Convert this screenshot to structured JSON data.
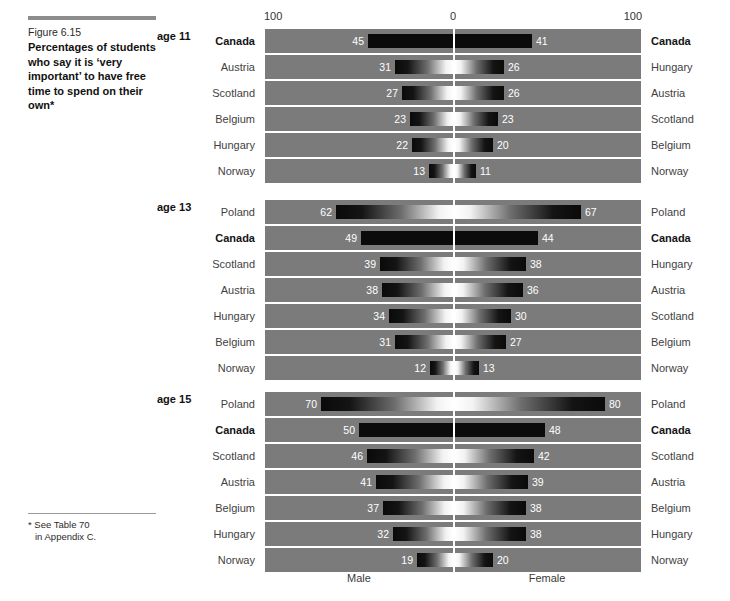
{
  "caption": {
    "figure_number": "Figure 6.15",
    "title": "Percentages of students who say it is ‘very important’ to have free time to spend on their own*"
  },
  "footnote": {
    "line1": "*  See Table 70",
    "line2": "in Appendix C."
  },
  "axis": {
    "left_tick": "100",
    "mid_tick": "0",
    "right_tick": "100",
    "male_label": "Male",
    "female_label": "Female"
  },
  "chart_data": {
    "type": "bar",
    "title": "Percentages of students who say it is ‘very important’ to have free time to spend on their own",
    "subtitle": "Figure 6.15",
    "orientation": "horizontal-diverging",
    "xlabel": "",
    "ylabel": "",
    "xlim": [
      -100,
      100
    ],
    "unit": "percent",
    "grid": false,
    "legend": [
      "Male",
      "Female"
    ],
    "legend_position": "bottom",
    "highlight_country": "Canada",
    "note": "Each age panel is sorted independently; the left label column is ordered by Male value, the right label column by Female value.",
    "panels": [
      {
        "age_label": "age 11",
        "age": 11,
        "male": {
          "categories": [
            "Canada",
            "Austria",
            "Scotland",
            "Belgium",
            "Hungary",
            "Norway"
          ],
          "values": [
            45,
            31,
            27,
            23,
            22,
            13
          ]
        },
        "female": {
          "categories": [
            "Canada",
            "Hungary",
            "Austria",
            "Scotland",
            "Belgium",
            "Norway"
          ],
          "values": [
            41,
            26,
            26,
            23,
            20,
            11
          ]
        },
        "rows": [
          {
            "left_label": "Canada",
            "male": 45,
            "right_label": "Canada",
            "female": 41,
            "highlight": true
          },
          {
            "left_label": "Austria",
            "male": 31,
            "right_label": "Hungary",
            "female": 26,
            "highlight": false
          },
          {
            "left_label": "Scotland",
            "male": 27,
            "right_label": "Austria",
            "female": 26,
            "highlight": false
          },
          {
            "left_label": "Belgium",
            "male": 23,
            "right_label": "Scotland",
            "female": 23,
            "highlight": false
          },
          {
            "left_label": "Hungary",
            "male": 22,
            "right_label": "Belgium",
            "female": 20,
            "highlight": false
          },
          {
            "left_label": "Norway",
            "male": 13,
            "right_label": "Norway",
            "female": 11,
            "highlight": false
          }
        ]
      },
      {
        "age_label": "age 13",
        "age": 13,
        "male": {
          "categories": [
            "Poland",
            "Canada",
            "Scotland",
            "Austria",
            "Hungary",
            "Belgium",
            "Norway"
          ],
          "values": [
            62,
            49,
            39,
            38,
            34,
            31,
            12
          ]
        },
        "female": {
          "categories": [
            "Poland",
            "Canada",
            "Hungary",
            "Austria",
            "Scotland",
            "Belgium",
            "Norway"
          ],
          "values": [
            67,
            44,
            38,
            36,
            30,
            27,
            13
          ]
        },
        "rows": [
          {
            "left_label": "Poland",
            "male": 62,
            "right_label": "Poland",
            "female": 67,
            "highlight": false
          },
          {
            "left_label": "Canada",
            "male": 49,
            "right_label": "Canada",
            "female": 44,
            "highlight": true
          },
          {
            "left_label": "Scotland",
            "male": 39,
            "right_label": "Hungary",
            "female": 38,
            "highlight": false
          },
          {
            "left_label": "Austria",
            "male": 38,
            "right_label": "Austria",
            "female": 36,
            "highlight": false
          },
          {
            "left_label": "Hungary",
            "male": 34,
            "right_label": "Scotland",
            "female": 30,
            "highlight": false
          },
          {
            "left_label": "Belgium",
            "male": 31,
            "right_label": "Belgium",
            "female": 27,
            "highlight": false
          },
          {
            "left_label": "Norway",
            "male": 12,
            "right_label": "Norway",
            "female": 13,
            "highlight": false
          }
        ]
      },
      {
        "age_label": "age 15",
        "age": 15,
        "male": {
          "categories": [
            "Poland",
            "Canada",
            "Scotland",
            "Austria",
            "Belgium",
            "Hungary",
            "Norway"
          ],
          "values": [
            70,
            50,
            46,
            41,
            37,
            32,
            19
          ]
        },
        "female": {
          "categories": [
            "Poland",
            "Canada",
            "Scotland",
            "Austria",
            "Belgium",
            "Hungary",
            "Norway"
          ],
          "values": [
            80,
            48,
            42,
            39,
            38,
            38,
            20
          ]
        },
        "rows": [
          {
            "left_label": "Poland",
            "male": 70,
            "right_label": "Poland",
            "female": 80,
            "highlight": false
          },
          {
            "left_label": "Canada",
            "male": 50,
            "right_label": "Canada",
            "female": 48,
            "highlight": true
          },
          {
            "left_label": "Scotland",
            "male": 46,
            "right_label": "Scotland",
            "female": 42,
            "highlight": false
          },
          {
            "left_label": "Austria",
            "male": 41,
            "right_label": "Austria",
            "female": 39,
            "highlight": false
          },
          {
            "left_label": "Belgium",
            "male": 37,
            "right_label": "Belgium",
            "female": 38,
            "highlight": false
          },
          {
            "left_label": "Hungary",
            "male": 32,
            "right_label": "Hungary",
            "female": 38,
            "highlight": false
          },
          {
            "left_label": "Norway",
            "male": 19,
            "right_label": "Norway",
            "female": 20,
            "highlight": false
          }
        ]
      }
    ]
  },
  "colors": {
    "plot_background": "#7b7b7b",
    "bar_dark": "#0b0b0b",
    "bar_light": "#ffffff",
    "zero_line": "#ffffff",
    "text": "#3a3a3a",
    "rule": "#8c8c8c"
  }
}
